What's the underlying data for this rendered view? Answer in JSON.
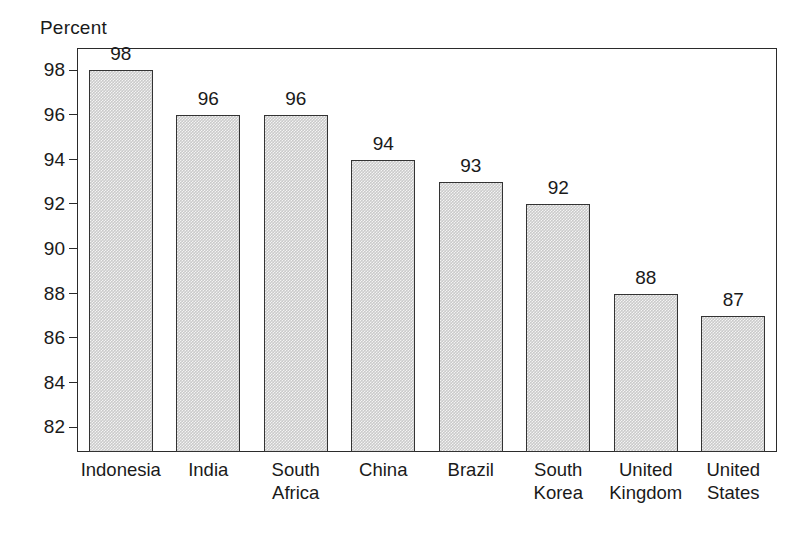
{
  "chart_data": {
    "type": "bar",
    "title": "Percent",
    "xlabel": "",
    "ylabel": "Percent",
    "categories": [
      "Indonesia",
      "India",
      "South Africa",
      "China",
      "Brazil",
      "South Korea",
      "United Kingdom",
      "United States"
    ],
    "category_lines": [
      [
        "Indonesia"
      ],
      [
        "India"
      ],
      [
        "South",
        "Africa"
      ],
      [
        "China"
      ],
      [
        "Brazil"
      ],
      [
        "South",
        "Korea"
      ],
      [
        "United",
        "Kingdom"
      ],
      [
        "United",
        "States"
      ]
    ],
    "values": [
      98,
      96,
      96,
      94,
      93,
      92,
      88,
      87
    ],
    "value_labels": [
      "98",
      "96",
      "96",
      "94",
      "93",
      "92",
      "88",
      "87"
    ],
    "ylim": [
      80.9,
      99.0
    ],
    "yticks": [
      82,
      84,
      86,
      88,
      90,
      92,
      94,
      96,
      98
    ],
    "ytick_labels": [
      "82",
      "84",
      "86",
      "88",
      "90",
      "92",
      "94",
      "96",
      "98"
    ],
    "grid": false,
    "legend": null,
    "legend_position": "none",
    "colors": {
      "bar_fill": "#cacaca",
      "bar_border": "#333333",
      "axis": "#2b2b2b",
      "text": "#1a1a1a",
      "background": "#ffffff"
    }
  }
}
